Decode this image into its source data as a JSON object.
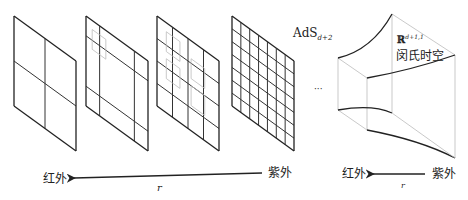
{
  "diagram": {
    "panels": [
      {
        "name": "panel-1",
        "grid_divisions": 2,
        "has_inset_boxes": false
      },
      {
        "name": "panel-2",
        "grid_divisions": 3,
        "has_inset_boxes": true
      },
      {
        "name": "panel-3",
        "grid_divisions": 4,
        "has_inset_boxes": true
      },
      {
        "name": "panel-4",
        "grid_divisions": 7,
        "has_inset_boxes": false
      }
    ],
    "ads_label": {
      "base": "AdS",
      "subscript": "d+2"
    },
    "ellipsis": "···",
    "minkowski": {
      "symbol": "ℝ",
      "superscript": "d+1,1",
      "caption": "闵氏时空"
    },
    "left_axis": {
      "from_label": "紫外",
      "to_label": "红外",
      "variable": "r"
    },
    "right_axis": {
      "from_label": "紫外",
      "to_label": "红外",
      "variable": "r"
    }
  }
}
